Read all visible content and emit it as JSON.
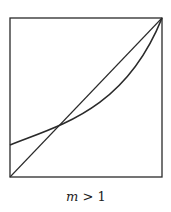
{
  "figure": {
    "caption_var": "m",
    "caption_rest": " > 1",
    "box": {
      "x": 10,
      "y": 18,
      "width": 152,
      "height": 159
    },
    "diagonal": {
      "x1": 10,
      "y1": 177,
      "x2": 162,
      "y2": 18
    },
    "curve_path": "M10,145 C60,125 125,110 162,18",
    "stroke_color": "#2a2a2a"
  },
  "chart_data": {
    "type": "line",
    "title": "",
    "caption": "m > 1",
    "xlabel": "",
    "ylabel": "",
    "xlim": [
      0,
      1
    ],
    "ylim": [
      0,
      1
    ],
    "grid": false,
    "series": [
      {
        "name": "diagonal",
        "x": [
          0,
          1
        ],
        "y": [
          0,
          1
        ]
      },
      {
        "name": "convex curve",
        "x": [
          0,
          0.29,
          0.5,
          0.75,
          1
        ],
        "y": [
          0.2,
          0.29,
          0.42,
          0.62,
          1
        ]
      }
    ],
    "annotations": [
      "curve crosses diagonal at approx (0.29, 0.29)"
    ]
  }
}
